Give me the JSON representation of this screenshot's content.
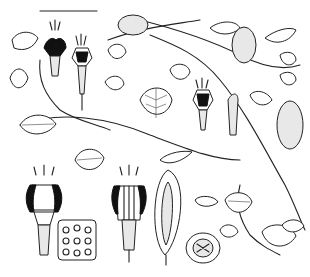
{
  "illustration": {
    "type": "botanical line drawing",
    "subject": "climbing vine with heart-shaped leaves, tubular flowers, fruits and dissections",
    "colors": {
      "background": "#ffffff",
      "ink": "#222222"
    },
    "scale_bar": {
      "x1": 40,
      "x2": 97,
      "y": 11
    },
    "elements": [
      {
        "name": "vine-stem-main"
      },
      {
        "name": "flower-upper-left-1"
      },
      {
        "name": "flower-upper-left-2"
      },
      {
        "name": "flower-center"
      },
      {
        "name": "fruit-top"
      },
      {
        "name": "fruit-upper-right"
      },
      {
        "name": "fruit-right"
      },
      {
        "name": "flower-dissection-left"
      },
      {
        "name": "ovary-cross-section"
      },
      {
        "name": "flower-dissection-center"
      },
      {
        "name": "fruit-longitudinal-section"
      },
      {
        "name": "fruit-cross-section"
      }
    ]
  }
}
